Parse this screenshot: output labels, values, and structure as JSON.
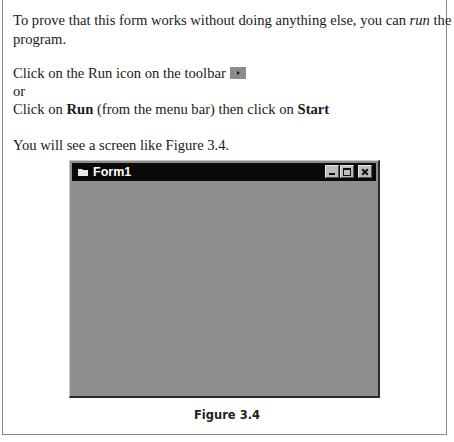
{
  "document": {
    "paragraph1": {
      "before": "To prove that this form works without doing anything else, you can ",
      "emphasis": "run",
      "after": " the",
      "line2": "program."
    },
    "instruction1": {
      "text": "Click on the Run icon on the toolbar",
      "icon": "run-icon"
    },
    "or_text": "or",
    "instruction2": {
      "prefix": "Click on ",
      "menu": "Run",
      "middle": " (from the menu bar) then click on ",
      "item": "Start"
    },
    "paragraph3": "You will see a screen like Figure 3.4."
  },
  "figure": {
    "window": {
      "title": "Form1",
      "icon": "form-icon",
      "controls": [
        "minimize",
        "maximize",
        "close"
      ],
      "titlebar_color": "#0a0a0a",
      "client_color": "#8e8e8e"
    },
    "caption": "Figure 3.4"
  }
}
